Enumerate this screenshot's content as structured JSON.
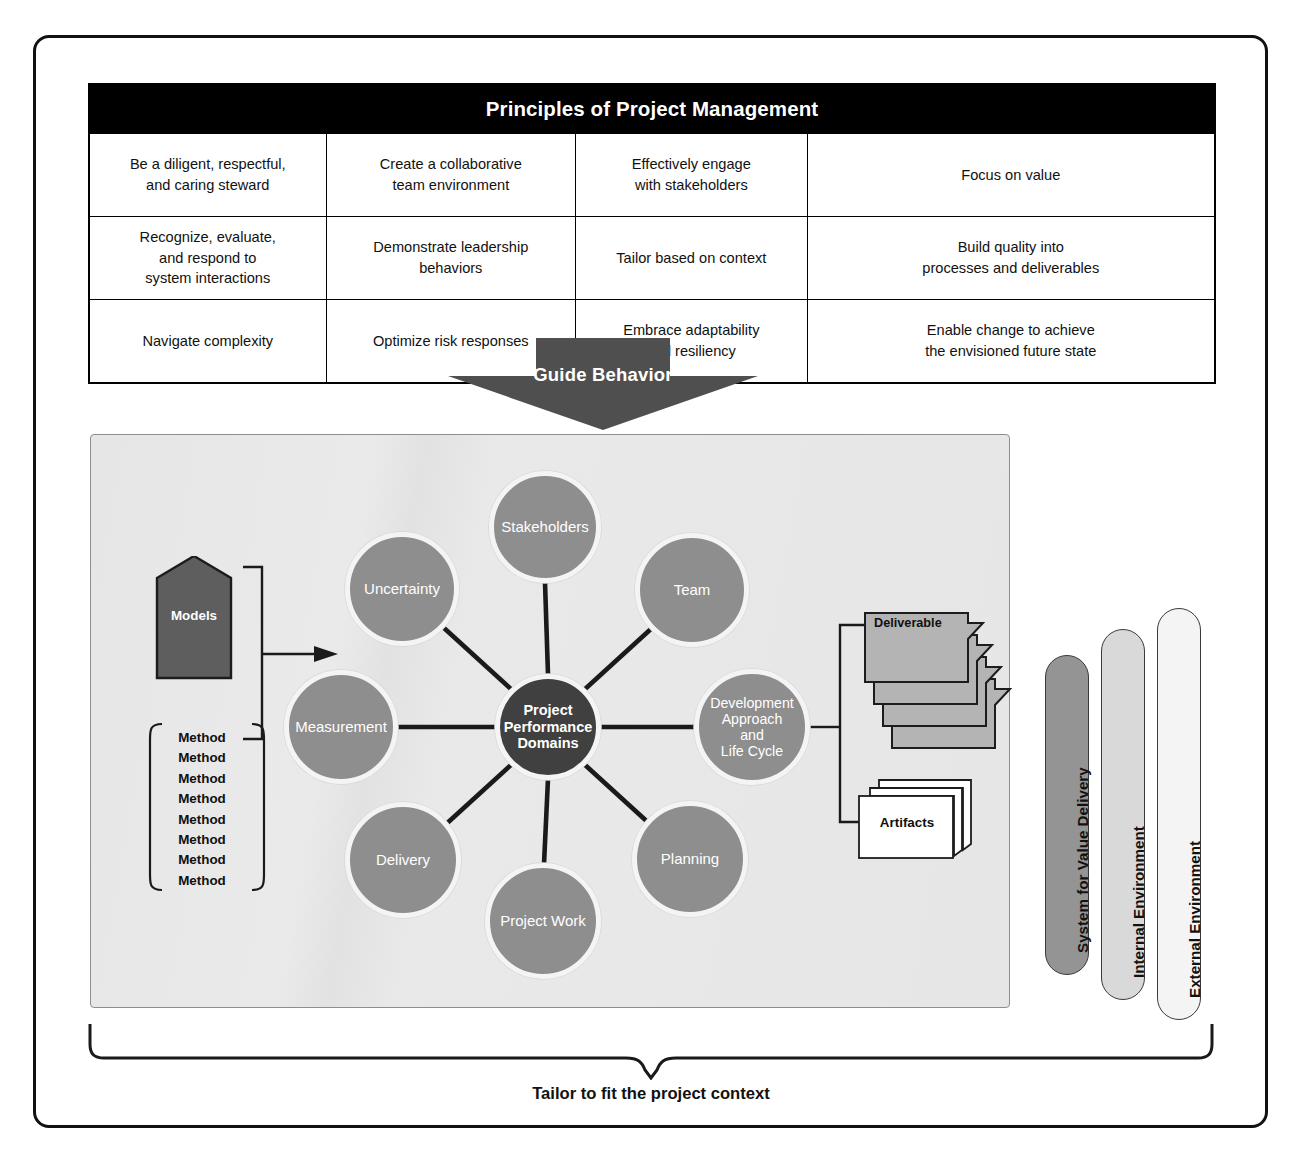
{
  "principles": {
    "title": "Principles of Project Management",
    "columns": 4,
    "rows": [
      [
        "Be a diligent, respectful,\nand caring steward",
        "Create a collaborative\nteam environment",
        "Effectively engage\nwith stakeholders",
        "Focus on value"
      ],
      [
        "Recognize, evaluate,\nand respond to\nsystem interactions",
        "Demonstrate leadership\nbehaviors",
        "Tailor based on context",
        "Build quality into\nprocesses and deliverables"
      ],
      [
        "Navigate complexity",
        "Optimize risk responses",
        "Embrace adaptability\nand resiliency",
        "Enable change to achieve\nthe envisioned future state"
      ]
    ]
  },
  "guide_arrow": {
    "label": "Guide Behavior",
    "color": "#4f4f4f",
    "text_color": "#ffffff"
  },
  "value_system": {
    "center": {
      "label": "Project\nPerformance\nDomains",
      "color": "#404040"
    },
    "domains": [
      {
        "label": "Stakeholders"
      },
      {
        "label": "Team"
      },
      {
        "label": "Development\nApproach\nand\nLife Cycle"
      },
      {
        "label": "Planning"
      },
      {
        "label": "Project Work"
      },
      {
        "label": "Delivery"
      },
      {
        "label": "Measurement"
      },
      {
        "label": "Uncertainty"
      }
    ],
    "domain_color": "#8e8e8e",
    "inputs": {
      "models_label": "Models",
      "models_color": "#5e5e5e",
      "methods": [
        "Method",
        "Method",
        "Method",
        "Method",
        "Method",
        "Method",
        "Method",
        "Method"
      ]
    },
    "outputs": {
      "deliverables": [
        "Deliverable",
        "Deliverable",
        "Deliverable",
        "Deliverable"
      ],
      "deliverable_color": "#b4b4b4",
      "artifacts_label": "Artifacts",
      "artifacts_color": "#ffffff"
    },
    "panel_color": "#e6e6e6"
  },
  "environments": [
    {
      "label": "System for Value Delivery",
      "color": "#949494"
    },
    {
      "label": "Internal Environment",
      "color": "#d9d9d9"
    },
    {
      "label": "External Environment",
      "color": "#f4f4f4"
    }
  ],
  "footer": {
    "tailor_caption": "Tailor to fit the project context"
  }
}
